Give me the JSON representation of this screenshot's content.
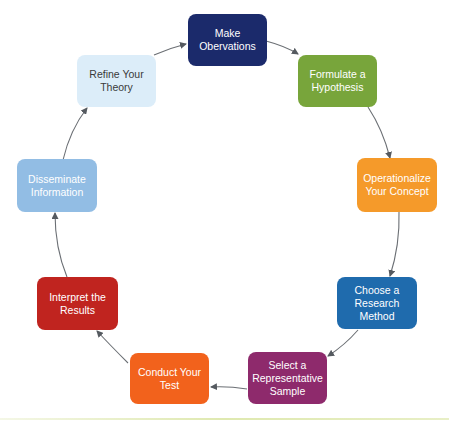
{
  "diagram": {
    "type": "cycle",
    "nodes": [
      {
        "id": "make-observations",
        "label": "Make Obervations",
        "lines": [
          "Make",
          "Obervations"
        ],
        "color": "#1b2a6b",
        "text_color": "#ffffff"
      },
      {
        "id": "formulate-hypothesis",
        "label": "Formulate a Hypothesis",
        "lines": [
          "Formulate a",
          "Hypothesis"
        ],
        "color": "#78a53b",
        "text_color": "#ffffff"
      },
      {
        "id": "operationalize-concept",
        "label": "Operationalize Your Concept",
        "lines": [
          "Operationalize",
          "Your Concept"
        ],
        "color": "#f59a2a",
        "text_color": "#ffffff"
      },
      {
        "id": "choose-research-method",
        "label": "Choose a Research Method",
        "lines": [
          "Choose a",
          "Research",
          "Method"
        ],
        "color": "#1f6bad",
        "text_color": "#ffffff"
      },
      {
        "id": "select-sample",
        "label": "Select a Representative Sample",
        "lines": [
          "Select a",
          "Representative",
          "Sample"
        ],
        "color": "#8e2a6c",
        "text_color": "#ffffff"
      },
      {
        "id": "conduct-test",
        "label": "Conduct Your Test",
        "lines": [
          "Conduct Your",
          "Test"
        ],
        "color": "#f2621c",
        "text_color": "#ffffff"
      },
      {
        "id": "interpret-results",
        "label": "Interpret the Results",
        "lines": [
          "Interpret the",
          "Results"
        ],
        "color": "#c0241f",
        "text_color": "#ffffff"
      },
      {
        "id": "disseminate-information",
        "label": "Disseminate Information",
        "lines": [
          "Disseminate",
          "Information"
        ],
        "color": "#92bde4",
        "text_color": "#ffffff"
      },
      {
        "id": "refine-theory",
        "label": "Refine Your Theory",
        "lines": [
          "Refine Your",
          "Theory"
        ],
        "color": "#dcedf9",
        "text_color": "#3a3a3a"
      }
    ],
    "edges": [
      {
        "from": "make-observations",
        "to": "formulate-hypothesis"
      },
      {
        "from": "formulate-hypothesis",
        "to": "operationalize-concept"
      },
      {
        "from": "operationalize-concept",
        "to": "choose-research-method"
      },
      {
        "from": "choose-research-method",
        "to": "select-sample"
      },
      {
        "from": "select-sample",
        "to": "conduct-test"
      },
      {
        "from": "conduct-test",
        "to": "interpret-results"
      },
      {
        "from": "interpret-results",
        "to": "disseminate-information"
      },
      {
        "from": "disseminate-information",
        "to": "refine-theory"
      },
      {
        "from": "refine-theory",
        "to": "make-observations"
      }
    ],
    "arrow_color": "#555a60"
  }
}
